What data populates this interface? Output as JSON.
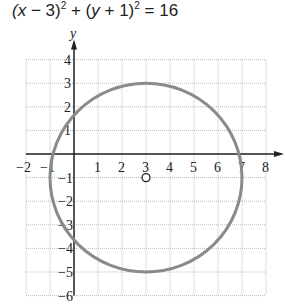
{
  "chart_data": {
    "type": "line",
    "xlabel": "",
    "ylabel": "y",
    "xlim": [
      -2,
      8
    ],
    "ylim": [
      -6,
      4
    ],
    "grid": true,
    "x_ticks": [
      "−2",
      "−1",
      "1",
      "2",
      "3",
      "4",
      "5",
      "6",
      "7",
      "8"
    ],
    "y_ticks": [
      "4",
      "3",
      "2",
      "1",
      "−1",
      "−2",
      "−3",
      "−4",
      "−5",
      "−6"
    ],
    "series": [
      {
        "name": "circle",
        "center": [
          3,
          -1
        ],
        "radius": 4
      }
    ],
    "annotations": [
      {
        "type": "open-point",
        "x": 3,
        "y": -1,
        "label": "center"
      }
    ]
  },
  "axis_label_y": "y"
}
